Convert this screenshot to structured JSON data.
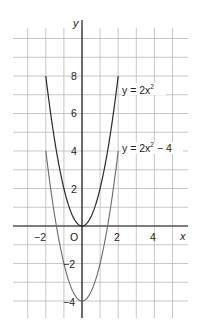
{
  "chart_data": {
    "type": "line",
    "title": "",
    "xlabel": "x",
    "ylabel": "y",
    "origin_label": "O",
    "xlim": [
      -3.8,
      5.8
    ],
    "ylim": [
      -4.9,
      11
    ],
    "grid": true,
    "x_ticks": [
      -2,
      2,
      4
    ],
    "x_tick_labels": [
      "−2",
      "2",
      "4"
    ],
    "y_ticks": [
      8,
      6,
      4,
      2,
      -2,
      -4
    ],
    "y_tick_labels": [
      "8",
      "6",
      "4",
      "2",
      "−2",
      "−4"
    ],
    "series": [
      {
        "name": "y = 2x²",
        "equation": "y = 2x^2",
        "x": [
          -2,
          -1.5,
          -1,
          -0.5,
          0,
          0.5,
          1,
          1.5,
          2
        ],
        "values": [
          8,
          4.5,
          2,
          0.5,
          0,
          0.5,
          2,
          4.5,
          8
        ]
      },
      {
        "name": "y = 2x² − 4",
        "equation": "y = 2x^2 - 4",
        "x": [
          -2,
          -1.5,
          -1,
          -0.5,
          0,
          0.5,
          1,
          1.5,
          2
        ],
        "values": [
          4,
          0.5,
          -2,
          -3.5,
          -4,
          -3.5,
          -2,
          0.5,
          4
        ]
      }
    ],
    "annotations": [
      {
        "text": "y = 2x²",
        "near": [
          2.2,
          7
        ]
      },
      {
        "text": "y = 2x² − 4",
        "near": [
          2.2,
          3.7
        ]
      }
    ]
  },
  "labels": {
    "y_axis": "y",
    "x_axis": "x",
    "origin": "O",
    "tick_x_neg2": "−2",
    "tick_x_2": "2",
    "tick_x_4": "4",
    "tick_y_8": "8",
    "tick_y_6": "6",
    "tick_y_4": "4",
    "tick_y_2": "2",
    "tick_y_neg2": "−2",
    "tick_y_neg4": "−4",
    "curve1_prefix": "y = 2x",
    "curve1_sup": "2",
    "curve2_prefix": "y = 2x",
    "curve2_sup": "2",
    "curve2_suffix": " − 4"
  }
}
